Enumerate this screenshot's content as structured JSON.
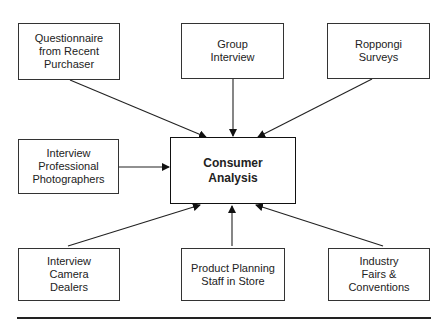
{
  "diagram": {
    "center": {
      "label": "Consumer\nAnalysis"
    },
    "sources": [
      {
        "id": "questionnaire",
        "label": "Questionnaire\nfrom Recent\nPurchaser"
      },
      {
        "id": "group-interview",
        "label": "Group\nInterview"
      },
      {
        "id": "roppongi",
        "label": "Roppongi\nSurveys"
      },
      {
        "id": "photographers",
        "label": "Interview\nProfessional\nPhotographers"
      },
      {
        "id": "camera-dealers",
        "label": "Interview\nCamera\nDealers"
      },
      {
        "id": "planning-staff",
        "label": "Product Planning\nStaff in Store"
      },
      {
        "id": "industry-fairs",
        "label": "Industry\nFairs &\nConventions"
      }
    ]
  }
}
